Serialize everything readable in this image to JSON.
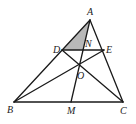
{
  "diagram": {
    "type": "geometry-triangle",
    "shaded_region": [
      "A",
      "D",
      "N"
    ],
    "colors": {
      "line": "#1a1a1a",
      "shade": "#b8b8b8",
      "label": "#222222"
    },
    "points": {
      "A": {
        "label": "A",
        "x": 90,
        "y": 20
      },
      "B": {
        "label": "B",
        "x": 14,
        "y": 102
      },
      "C": {
        "label": "C",
        "x": 123,
        "y": 102
      },
      "D": {
        "label": "D",
        "x": 62,
        "y": 50
      },
      "E": {
        "label": "E",
        "x": 104,
        "y": 50
      },
      "N": {
        "label": "N",
        "x": 83,
        "y": 50
      },
      "O": {
        "label": "O",
        "x": 80,
        "y": 64
      },
      "M": {
        "label": "M",
        "x": 71,
        "y": 102
      }
    },
    "segments": [
      [
        "A",
        "B"
      ],
      [
        "A",
        "C"
      ],
      [
        "B",
        "C"
      ],
      [
        "D",
        "E"
      ],
      [
        "A",
        "M"
      ],
      [
        "B",
        "E"
      ],
      [
        "C",
        "D"
      ]
    ],
    "labels": {
      "A": "A",
      "B": "B",
      "C": "C",
      "D": "D",
      "E": "E",
      "N": "N",
      "O": "O",
      "M": "M"
    }
  }
}
